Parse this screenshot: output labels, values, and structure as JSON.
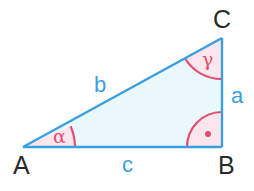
{
  "diagram": {
    "colors": {
      "edge": "#3a9fe0",
      "fill": "#e8f8fb",
      "angle_arc": "#e0506e",
      "angle_fill": "#fbe6ee",
      "vertex_label": "#2a2a2a",
      "side_label": "#3a9fe0",
      "angle_label": "#e0506e"
    },
    "vertices": [
      {
        "id": "A",
        "label": "A",
        "x": 23,
        "y": 147
      },
      {
        "id": "B",
        "label": "B",
        "x": 222,
        "y": 147
      },
      {
        "id": "C",
        "label": "C",
        "x": 222,
        "y": 38
      }
    ],
    "sides": [
      {
        "id": "a",
        "label": "a",
        "from": "B",
        "to": "C"
      },
      {
        "id": "b",
        "label": "b",
        "from": "A",
        "to": "C"
      },
      {
        "id": "c",
        "label": "c",
        "from": "A",
        "to": "B"
      }
    ],
    "angles": [
      {
        "id": "alpha",
        "label": "α",
        "vertex": "A"
      },
      {
        "id": "gamma",
        "label": "γ",
        "vertex": "C"
      },
      {
        "id": "right",
        "label": "•",
        "vertex": "B",
        "type": "right-angle"
      }
    ]
  }
}
